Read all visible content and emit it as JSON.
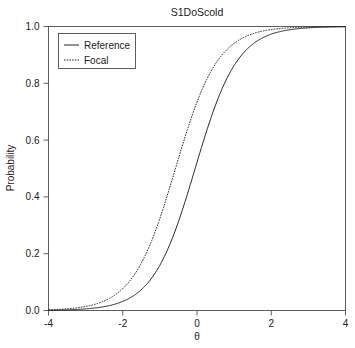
{
  "chart_data": {
    "type": "line",
    "title": "S1DoScold",
    "xlabel": "θ",
    "ylabel": "Probability",
    "xlim": [
      -4,
      4
    ],
    "ylim": [
      0,
      1
    ],
    "grid": false,
    "legend_position": "top-left",
    "xticks": [
      -4,
      -2,
      0,
      2,
      4
    ],
    "xticklabels": [
      "-4",
      "-2",
      "0",
      "2",
      "4"
    ],
    "yticks": [
      0.0,
      0.2,
      0.4,
      0.6,
      0.8,
      1.0
    ],
    "yticklabels": [
      "0.0",
      "0.2",
      "0.4",
      "0.6",
      "0.8",
      "1.0"
    ],
    "series": [
      {
        "name": "Reference",
        "linestyle": "solid",
        "color": "#1a1a1a",
        "model": "2pl",
        "a": 1.75,
        "b": -0.05,
        "x": [
          -4.0,
          -3.75,
          -3.5,
          -3.25,
          -3.0,
          -2.75,
          -2.5,
          -2.25,
          -2.0,
          -1.75,
          -1.5,
          -1.25,
          -1.0,
          -0.75,
          -0.5,
          -0.25,
          0.0,
          0.25,
          0.5,
          0.75,
          1.0,
          1.25,
          1.5,
          1.75,
          2.0,
          2.25,
          2.5,
          2.75,
          3.0,
          3.25,
          3.5,
          3.75,
          4.0
        ],
        "values": [
          0.001,
          0.002,
          0.003,
          0.004,
          0.006,
          0.01,
          0.015,
          0.023,
          0.035,
          0.053,
          0.079,
          0.117,
          0.169,
          0.238,
          0.323,
          0.42,
          0.522,
          0.621,
          0.711,
          0.787,
          0.847,
          0.893,
          0.926,
          0.95,
          0.966,
          0.978,
          0.985,
          0.99,
          0.993,
          0.996,
          0.997,
          0.998,
          0.999
        ]
      },
      {
        "name": "Focal",
        "linestyle": "dotted",
        "color": "#1a1a1a",
        "model": "2pl",
        "a": 1.75,
        "b": -0.58,
        "x": [
          -4.0,
          -3.75,
          -3.5,
          -3.25,
          -3.0,
          -2.75,
          -2.5,
          -2.25,
          -2.0,
          -1.75,
          -1.5,
          -1.25,
          -1.0,
          -0.75,
          -0.5,
          -0.25,
          0.0,
          0.25,
          0.5,
          0.75,
          1.0,
          1.25,
          1.5,
          1.75,
          2.0,
          2.25,
          2.5,
          2.75,
          3.0,
          3.25,
          3.5,
          3.75,
          4.0
        ],
        "values": [
          0.002,
          0.004,
          0.006,
          0.01,
          0.015,
          0.023,
          0.035,
          0.053,
          0.079,
          0.117,
          0.169,
          0.239,
          0.324,
          0.421,
          0.523,
          0.622,
          0.712,
          0.788,
          0.848,
          0.893,
          0.927,
          0.951,
          0.967,
          0.978,
          0.985,
          0.99,
          0.994,
          0.996,
          0.997,
          0.998,
          0.999,
          0.999,
          1.0
        ]
      }
    ]
  },
  "legend": {
    "entries": [
      "Reference",
      "Focal"
    ]
  }
}
